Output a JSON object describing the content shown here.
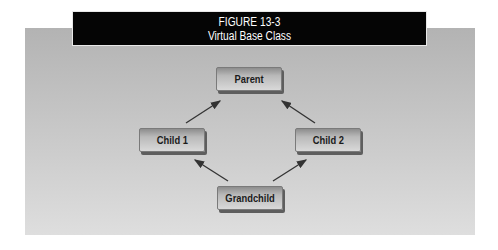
{
  "figure": {
    "label": "FIGURE 13-3",
    "title": "Virtual Base Class"
  },
  "nodes": [
    {
      "id": "parent",
      "label": "Parent"
    },
    {
      "id": "child1",
      "label": "Child 1"
    },
    {
      "id": "child2",
      "label": "Child 2"
    },
    {
      "id": "grandchild",
      "label": "Grandchild"
    }
  ],
  "edges": [
    {
      "from": "child1",
      "to": "parent"
    },
    {
      "from": "child2",
      "to": "parent"
    },
    {
      "from": "grandchild",
      "to": "child1"
    },
    {
      "from": "grandchild",
      "to": "child2"
    }
  ],
  "colors": {
    "title_bg": "#050505",
    "title_text": "#ffffff",
    "panel_bg": "#c4c4c4",
    "arrow": "#333333"
  }
}
